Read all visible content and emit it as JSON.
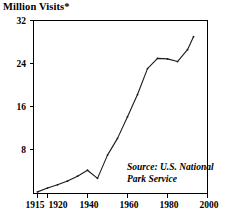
{
  "figure": {
    "axis_title": "Million Visits*",
    "source_note_line1": "Source: U.S. National",
    "source_note_line2": "Park Service"
  },
  "chart_data": {
    "type": "line",
    "title": "Million Visits*",
    "xlabel": "",
    "ylabel": "Million Visits*",
    "xlim": [
      1913,
      2000
    ],
    "ylim": [
      0,
      32
    ],
    "yticks": [
      8,
      16,
      24,
      32
    ],
    "ytick_labels": [
      "8",
      "16",
      "24",
      "32"
    ],
    "xticks": [
      1915,
      1920,
      1940,
      1960,
      1980,
      2000
    ],
    "xtick_labels": [
      "1915",
      "1920",
      "1940",
      "1960",
      "1980",
      "2000"
    ],
    "grid": false,
    "legend": null,
    "annotations": [
      "Source: U.S. National Park Service"
    ],
    "line_color": "#1a1a1a",
    "series": [
      {
        "name": "National Park visits",
        "x": [
          1915,
          1920,
          1925,
          1930,
          1935,
          1940,
          1945,
          1950,
          1955,
          1960,
          1965,
          1970,
          1975,
          1980,
          1985,
          1990,
          1993
        ],
        "values": [
          0.3,
          1.0,
          1.6,
          2.3,
          3.2,
          4.3,
          2.8,
          7.1,
          10.2,
          14.2,
          18.3,
          23.1,
          25.0,
          24.9,
          24.4,
          26.6,
          29.0
        ]
      }
    ]
  }
}
